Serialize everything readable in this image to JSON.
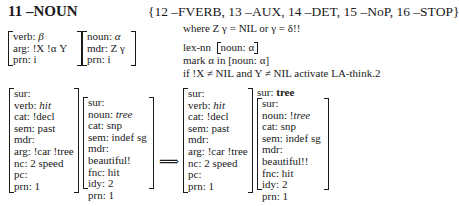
{
  "rule": {
    "name": "11 –NOUN",
    "package": "{12 –FVERB, 13 –AUX, 14 –DET, 15 –NoP, 16 –STOP}"
  },
  "pattern": {
    "box1": [
      {
        "key": "verb: ",
        "val": "β",
        "style": "it"
      },
      {
        "key": "arg: ",
        "val": "!X !α Y",
        "style": ""
      },
      {
        "key": "prn: ",
        "val": "i",
        "style": ""
      }
    ],
    "box2": [
      {
        "key": "noun: ",
        "val": "α",
        "style": "it"
      },
      {
        "key": "mdr: ",
        "val": "Z γ",
        "style": ""
      },
      {
        "key": "prn: ",
        "val": "i",
        "style": ""
      }
    ]
  },
  "conditions": {
    "where": "where Z γ = NIL or γ = δ!!",
    "lexnn_label": "lex-nn",
    "lexnn_box": "noun: α",
    "mark": "mark α in [noun: α]",
    "activate": "if !X ≠ NIL and Y ≠ NIL activate LA-think.2"
  },
  "input": {
    "verb_proplet": [
      {
        "key": "sur:",
        "val": "",
        "style": ""
      },
      {
        "key": "verb: ",
        "val": "hit",
        "style": "it"
      },
      {
        "key": "cat: ",
        "val": "!decl",
        "style": ""
      },
      {
        "key": "sem: ",
        "val": "past",
        "style": ""
      },
      {
        "key": "mdr:",
        "val": "",
        "style": ""
      },
      {
        "key": "arg: ",
        "val": "!car !tree",
        "style": ""
      },
      {
        "key": "nc: ",
        "val": "2 speed",
        "style": ""
      },
      {
        "key": "pc:",
        "val": "",
        "style": ""
      },
      {
        "key": "prn: ",
        "val": "1",
        "style": ""
      }
    ],
    "noun_proplet": [
      {
        "key": "sur:",
        "val": "",
        "style": ""
      },
      {
        "key": "noun: ",
        "val": "tree",
        "style": "it"
      },
      {
        "key": "cat: ",
        "val": "snp",
        "style": ""
      },
      {
        "key": "sem: ",
        "val": "indef sg",
        "style": ""
      },
      {
        "key": "mdr: ",
        "val": "beautiful!",
        "style": ""
      },
      {
        "key": "fnc: ",
        "val": "hit",
        "style": ""
      },
      {
        "key": "idy: ",
        "val": "2",
        "style": ""
      },
      {
        "key": "prn: ",
        "val": "1",
        "style": ""
      }
    ]
  },
  "arrow": "⟹",
  "output": {
    "verb_proplet": [
      {
        "key": "sur:",
        "val": "",
        "style": ""
      },
      {
        "key": "verb: ",
        "val": "hit",
        "style": "it"
      },
      {
        "key": "cat: ",
        "val": "!decl",
        "style": ""
      },
      {
        "key": "sem: ",
        "val": "past",
        "style": ""
      },
      {
        "key": "mdr:",
        "val": "",
        "style": ""
      },
      {
        "key": "arg: ",
        "val": "!car !tree",
        "style": ""
      },
      {
        "key": "nc: ",
        "val": "2 speed",
        "style": ""
      },
      {
        "key": "pc:",
        "val": "",
        "style": ""
      },
      {
        "key": "prn: ",
        "val": "1",
        "style": ""
      }
    ],
    "surface_label": "sur: ",
    "surface_value": "tree",
    "noun_proplet": [
      {
        "key": "sur:",
        "val": "",
        "style": ""
      },
      {
        "key": "noun: !",
        "val": "tree",
        "style": "it"
      },
      {
        "key": "cat: ",
        "val": "snp",
        "style": ""
      },
      {
        "key": "sem: ",
        "val": "indef sg",
        "style": ""
      },
      {
        "key": "mdr: ",
        "val": "beautiful!!",
        "style": ""
      },
      {
        "key": "fnc: ",
        "val": "hit",
        "style": ""
      },
      {
        "key": "idy: ",
        "val": "2",
        "style": ""
      },
      {
        "key": "prn: ",
        "val": "1",
        "style": ""
      }
    ]
  }
}
